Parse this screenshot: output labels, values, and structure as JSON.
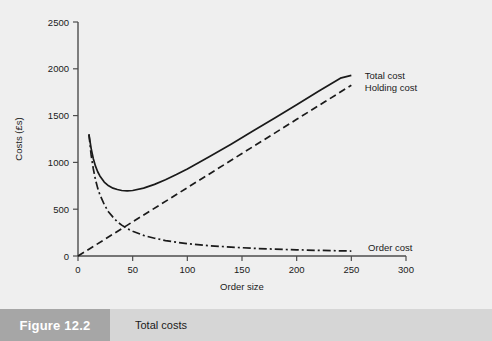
{
  "figure": {
    "number": "Figure 12.2",
    "caption": "Total costs",
    "number_box_color": "#a6a6a6",
    "caption_bar_color": "#d6d6d6",
    "background_color": "#efefef"
  },
  "chart_data": {
    "type": "line",
    "title": "",
    "xlabel": "Order size",
    "ylabel": "Costs (£s)",
    "xlim": [
      0,
      300
    ],
    "ylim": [
      0,
      2500
    ],
    "xticks": [
      0,
      50,
      100,
      150,
      200,
      250,
      300
    ],
    "xtick_labels": [
      "0",
      "50",
      "100",
      "150",
      "200",
      "250",
      "300"
    ],
    "yticks": [
      0,
      500,
      1000,
      1500,
      2000,
      2500
    ],
    "ytick_labels": [
      "0",
      "500",
      "1000",
      "1500",
      "2000",
      "2500"
    ],
    "grid": false,
    "legend_position": "inline-right",
    "line_color": "#1a1a1a",
    "series": [
      {
        "name": "Total cost",
        "style": "solid",
        "label_x": 255,
        "label_y": 1930,
        "x": [
          10,
          12,
          14,
          16,
          18,
          20,
          24,
          28,
          32,
          36,
          40,
          45,
          50,
          60,
          70,
          80,
          90,
          100,
          120,
          140,
          160,
          180,
          200,
          220,
          240,
          250
        ],
        "y": [
          1300,
          1150,
          1040,
          960,
          900,
          855,
          790,
          750,
          725,
          710,
          700,
          695,
          700,
          725,
          765,
          815,
          870,
          930,
          1060,
          1195,
          1335,
          1475,
          1615,
          1760,
          1900,
          1930
        ]
      },
      {
        "name": "Holding cost",
        "style": "dashed",
        "label_x": 255,
        "label_y": 1800,
        "x": [
          0,
          25,
          50,
          75,
          100,
          125,
          150,
          175,
          200,
          225,
          250
        ],
        "y": [
          0,
          182,
          365,
          547,
          730,
          912,
          1095,
          1277,
          1460,
          1642,
          1825
        ]
      },
      {
        "name": "Order cost",
        "style": "dash-dot",
        "label_x": 258,
        "label_y": 95,
        "x": [
          10,
          12,
          14,
          16,
          18,
          20,
          24,
          28,
          32,
          36,
          40,
          45,
          50,
          60,
          70,
          80,
          90,
          100,
          120,
          140,
          160,
          180,
          200,
          220,
          240,
          250
        ],
        "y": [
          1300,
          1080,
          930,
          815,
          725,
          655,
          550,
          470,
          415,
          365,
          330,
          292,
          265,
          220,
          190,
          165,
          147,
          132,
          110,
          95,
          82,
          73,
          66,
          60,
          55,
          53
        ]
      }
    ]
  }
}
